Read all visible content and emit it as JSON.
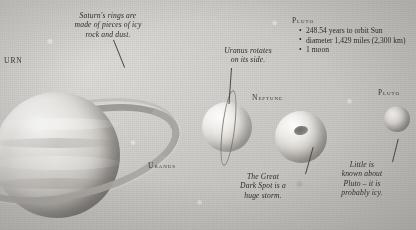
{
  "scene": {
    "title": "Outer planets illustration",
    "background_color": "#cfcfcb",
    "ink_color": "#2b2b2b"
  },
  "annotations": {
    "saturn_rings": "Saturn's rings are\nmade of pieces of icy\nrock and dust.",
    "uranus_rotation": "Uranus rotates\non its side.",
    "dark_spot": "The Great\nDark Spot is a\nhuge storm.",
    "pluto_unknown": "Little is\nknown about\nPluto – it is\nprobably icy."
  },
  "labels": {
    "saturn": "URN",
    "uranus": "Uranus",
    "neptune": "Neptune",
    "pluto_planet": "Pluto"
  },
  "factbox": {
    "heading": "Pluto",
    "items": [
      "248.54 years to orbit Sun",
      "diameter 1,429 miles (2,300 km)",
      "1 moon"
    ]
  }
}
